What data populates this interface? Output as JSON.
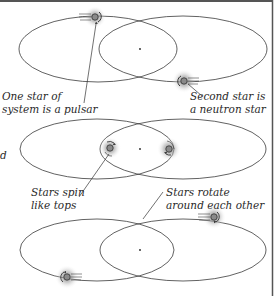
{
  "colors": {
    "border": "#555555",
    "orbit": "#3a3a3a",
    "star_fill": "#8a8a8a",
    "glow": "#9a9a9a",
    "text": "#2a2a2a"
  },
  "panels": [
    {
      "id": "panel-1",
      "labels": [
        {
          "name": "pulsar-label",
          "lines": [
            "One star of",
            "system is a pulsar"
          ]
        },
        {
          "name": "neutron-star-label",
          "lines": [
            "Second star is",
            "a neutron star"
          ]
        }
      ]
    },
    {
      "id": "panel-2",
      "labels": [
        {
          "name": "spin-label",
          "lines": [
            "Stars spin",
            "like tops"
          ]
        },
        {
          "name": "rotate-label",
          "lines": [
            "Stars rotate",
            "around each other"
          ]
        }
      ],
      "edge_fragment": "d"
    },
    {
      "id": "panel-3",
      "labels": []
    }
  ],
  "text": {
    "pulsar_1": "One star of",
    "pulsar_2": "system is a pulsar",
    "neutron_1": "Second star is",
    "neutron_2": "a neutron star",
    "spin_1": "Stars spin",
    "spin_2": "like tops",
    "rotate_1": "Stars rotate",
    "rotate_2": "around each other",
    "edge_fragment": "d"
  }
}
